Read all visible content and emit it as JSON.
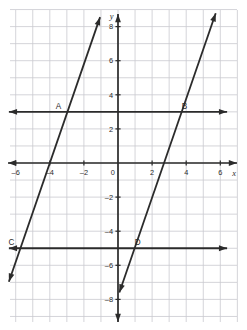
{
  "figure": {
    "width": 247,
    "height": 330,
    "background_color": "#ffffff",
    "grid_color": "#c9c9cf",
    "axis_color": "#2b2b2b",
    "line_color": "#2b2b2b"
  },
  "chart_data": {
    "type": "line",
    "title": "",
    "xlabel": "x",
    "ylabel": "y",
    "xlim": [
      -6.4,
      6.4
    ],
    "ylim": [
      -9.0,
      9.0
    ],
    "grid": true,
    "grid_step": 1,
    "legend": "none",
    "x_ticks": [
      -6,
      -4,
      -2,
      0,
      2,
      4,
      6
    ],
    "x_tick_labels": [
      "–6",
      "–4",
      "–2",
      "0",
      "2",
      "4",
      "6"
    ],
    "y_ticks": [
      8,
      6,
      4,
      2,
      -2,
      -4,
      -6,
      -8
    ],
    "y_tick_labels": [
      "8",
      "6",
      "4",
      "2",
      "–2",
      "–4",
      "–6",
      "–8"
    ],
    "series": [
      {
        "name": "horizontal-line-upper",
        "kind": "horizontal",
        "equation": "y = 3",
        "y": 3,
        "x_from": -6.4,
        "x_to": 6.4,
        "arrows": "both"
      },
      {
        "name": "horizontal-line-lower",
        "kind": "horizontal",
        "equation": "y = -5",
        "y": -5,
        "x_from": -6.4,
        "x_to": 6.4,
        "arrows": "both"
      },
      {
        "name": "slanted-line-left",
        "kind": "slanted",
        "equation": "y = 2.9x + 11.6",
        "slope": 2.9,
        "intercept": 11.6,
        "x_intercept": -4,
        "x_from": -6.4,
        "x_to": -1.05,
        "arrows": "both"
      },
      {
        "name": "slanted-line-right",
        "kind": "slanted",
        "equation": "y = 2.9x - 7.83",
        "slope": 2.9,
        "intercept": -7.83,
        "x_intercept": 2.7,
        "x_from": 0.08,
        "x_to": 5.73,
        "arrows": "both"
      }
    ],
    "points": [
      {
        "label": "A",
        "x": -2.97,
        "y": 3,
        "label_dx": -9,
        "label_dy": -3
      },
      {
        "label": "B",
        "x": 3.73,
        "y": 3,
        "label_dx": 3,
        "label_dy": -3
      },
      {
        "label": "C",
        "x": -5.72,
        "y": -5,
        "label_dx": -9,
        "label_dy": -3
      },
      {
        "label": "D",
        "x": 0.98,
        "y": -5,
        "label_dx": 3,
        "label_dy": -3
      }
    ],
    "annotations": [
      {
        "name": "y-axis-name",
        "text": "y"
      },
      {
        "name": "x-axis-name",
        "text": "x"
      }
    ]
  },
  "labels": {
    "point_a": "A",
    "point_b": "B",
    "point_c": "C",
    "point_d": "D",
    "axis_x": "x",
    "axis_y": "y",
    "x_tick_neg6": "–6",
    "x_tick_neg4": "–4",
    "x_tick_neg2": "–2",
    "x_tick_zero": "0",
    "x_tick_2": "2",
    "x_tick_4": "4",
    "x_tick_6": "6",
    "y_tick_8": "8",
    "y_tick_6": "6",
    "y_tick_4": "4",
    "y_tick_2": "2",
    "y_tick_neg2": "–2",
    "y_tick_neg4": "–4",
    "y_tick_neg6": "–6",
    "y_tick_neg8": "–8"
  }
}
